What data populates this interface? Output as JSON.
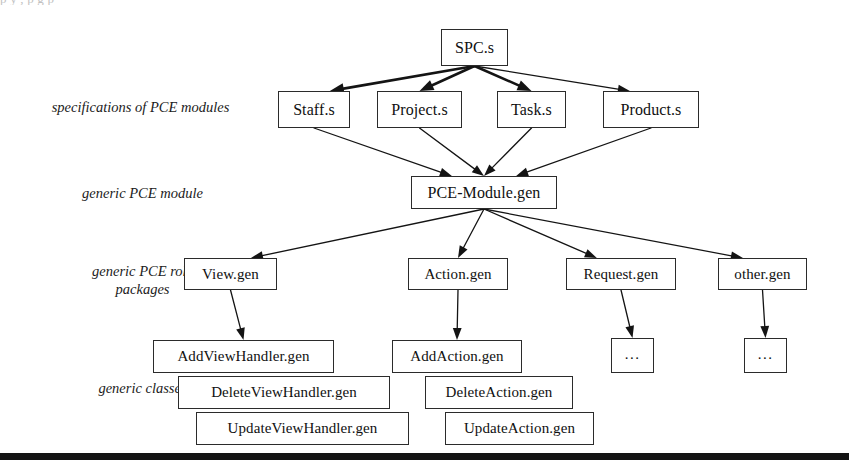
{
  "page": {
    "top_clipped_text": "p        y                                 ,          p                  g              p",
    "background_color": "#ffffff",
    "ink_color": "#141414",
    "bottom_rule": {
      "visible": true,
      "y": 453,
      "height": 7
    }
  },
  "row_labels": [
    {
      "id": "specs",
      "text": "specifications of PCE modules",
      "x": 28,
      "y": 98,
      "width": 225
    },
    {
      "id": "generic-module",
      "text": "generic PCE module",
      "x": 60,
      "y": 184,
      "width": 165
    },
    {
      "id": "role-packages",
      "text": "generic PCE role\npackages",
      "x": 60,
      "y": 262,
      "width": 165
    },
    {
      "id": "generic-classes",
      "text": "generic classes",
      "x": 60,
      "y": 379,
      "width": 165
    }
  ],
  "nodes": [
    {
      "id": "spc",
      "label": "SPC.s",
      "x": 441,
      "y": 29,
      "w": 67,
      "h": 37,
      "size": "f16"
    },
    {
      "id": "staff",
      "label": "Staff.s",
      "x": 278,
      "y": 91,
      "w": 72,
      "h": 37,
      "size": "f16"
    },
    {
      "id": "project",
      "label": "Project.s",
      "x": 377,
      "y": 91,
      "w": 85,
      "h": 37,
      "size": "f16"
    },
    {
      "id": "task",
      "label": "Task.s",
      "x": 497,
      "y": 91,
      "w": 69,
      "h": 37,
      "size": "f16"
    },
    {
      "id": "product",
      "label": "Product.s",
      "x": 603,
      "y": 91,
      "w": 96,
      "h": 37,
      "size": "f16"
    },
    {
      "id": "pcemodule",
      "label": "PCE-Module.gen",
      "x": 411,
      "y": 176,
      "w": 146,
      "h": 33,
      "size": "f16"
    },
    {
      "id": "view",
      "label": "View.gen",
      "x": 184,
      "y": 258,
      "w": 93,
      "h": 32,
      "size": "f15"
    },
    {
      "id": "action",
      "label": "Action.gen",
      "x": 408,
      "y": 258,
      "w": 100,
      "h": 32,
      "size": "f15"
    },
    {
      "id": "request",
      "label": "Request.gen",
      "x": 566,
      "y": 258,
      "w": 110,
      "h": 32,
      "size": "f15"
    },
    {
      "id": "other",
      "label": "other.gen",
      "x": 718,
      "y": 258,
      "w": 89,
      "h": 32,
      "size": "f15"
    },
    {
      "id": "addview",
      "label": "AddViewHandler.gen",
      "x": 153,
      "y": 340,
      "w": 181,
      "h": 33,
      "size": "f15"
    },
    {
      "id": "deleteview",
      "label": "DeleteViewHandler.gen",
      "x": 178,
      "y": 376,
      "w": 212,
      "h": 33,
      "size": "f15"
    },
    {
      "id": "updateview",
      "label": "UpdateViewHandler.gen",
      "x": 196,
      "y": 412,
      "w": 213,
      "h": 33,
      "size": "f15"
    },
    {
      "id": "addaction",
      "label": "AddAction.gen",
      "x": 392,
      "y": 340,
      "w": 130,
      "h": 33,
      "size": "f15"
    },
    {
      "id": "deleteaction",
      "label": "DeleteAction.gen",
      "x": 425,
      "y": 376,
      "w": 148,
      "h": 33,
      "size": "f15"
    },
    {
      "id": "updateaction",
      "label": "UpdateAction.gen",
      "x": 445,
      "y": 412,
      "w": 149,
      "h": 33,
      "size": "f15"
    },
    {
      "id": "requestdots",
      "label": "...",
      "x": 611,
      "y": 338,
      "w": 43,
      "h": 35,
      "size": "dots"
    },
    {
      "id": "otherdots",
      "label": "...",
      "x": 744,
      "y": 338,
      "w": 43,
      "h": 35,
      "size": "dots"
    }
  ],
  "edges": [
    {
      "from": "spc",
      "to": "staff",
      "kind": "arrow",
      "style": "thick"
    },
    {
      "from": "spc",
      "to": "project",
      "kind": "arrow",
      "style": "thick"
    },
    {
      "from": "spc",
      "to": "task",
      "kind": "arrow",
      "style": "thick"
    },
    {
      "from": "spc",
      "to": "product",
      "kind": "arrow",
      "style": "thin"
    },
    {
      "from": "staff",
      "to": "pcemodule",
      "kind": "arrow",
      "style": "thin"
    },
    {
      "from": "project",
      "to": "pcemodule",
      "kind": "arrow",
      "style": "thin"
    },
    {
      "from": "task",
      "to": "pcemodule",
      "kind": "arrow",
      "style": "thin"
    },
    {
      "from": "product",
      "to": "pcemodule",
      "kind": "arrow",
      "style": "thin"
    },
    {
      "from": "pcemodule",
      "to": "view",
      "kind": "arrow",
      "style": "thin"
    },
    {
      "from": "pcemodule",
      "to": "action",
      "kind": "arrow",
      "style": "thin"
    },
    {
      "from": "pcemodule",
      "to": "request",
      "kind": "arrow",
      "style": "thin"
    },
    {
      "from": "pcemodule",
      "to": "other",
      "kind": "arrow",
      "style": "thin"
    },
    {
      "from": "view",
      "to": "addview",
      "kind": "arrow",
      "style": "thin"
    },
    {
      "from": "action",
      "to": "addaction",
      "kind": "arrow",
      "style": "thin"
    },
    {
      "from": "request",
      "to": "requestdots",
      "kind": "arrow",
      "style": "thin"
    },
    {
      "from": "other",
      "to": "otherdots",
      "kind": "arrow",
      "style": "thin"
    }
  ]
}
